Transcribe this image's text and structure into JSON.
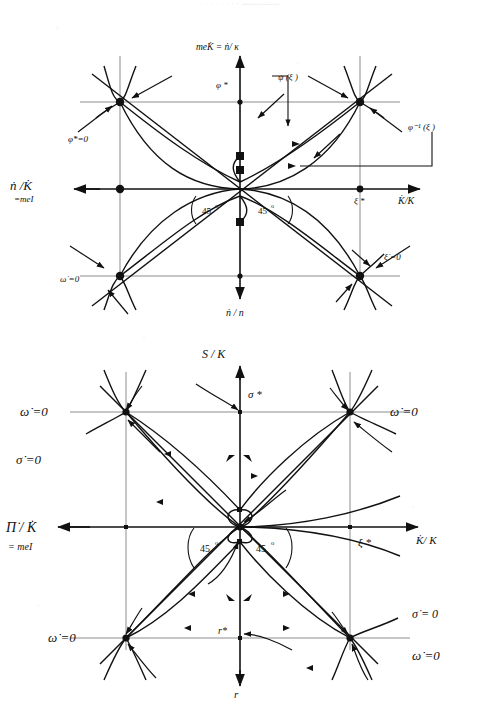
{
  "document": {
    "type": "scanned-figure-page",
    "header_faint_text": "· · ·   ·  ·                                      ·    ·  ▫ ▬▬▬▬▬",
    "ink_color": "#111111",
    "grid_color": "#8d8d8d",
    "paper_color": "#ffffff"
  },
  "figures": [
    {
      "id": "figure-1",
      "name": "phase-diagram-top",
      "axes": {
        "vertical_top_label": "meK̇ =  ṅ/ κ",
        "vertical_bottom_label": "ṅ / n",
        "horizontal_left_label": "ṅ /K̇",
        "horizontal_left_sublabel": "=meI",
        "horizontal_right_label": "K̇/K"
      },
      "markers": {
        "upper_star": "φ *",
        "right_star": "ξ *",
        "angle_left": "45",
        "angle_right": "45",
        "degree": "o"
      },
      "annotations": [
        {
          "name": "psi-xi-label",
          "text": "ψ (ξ )"
        },
        {
          "name": "phi-inverse-xi-label",
          "text": "φ⁻¹ (ξ )"
        },
        {
          "name": "phi-dot-star-zero-label",
          "text": "φ̇*=0"
        },
        {
          "name": "omega-dot-zero-label",
          "text": "ω̇ =0"
        },
        {
          "name": "xi-dot-zero-label",
          "text": "ξ̇ =0"
        }
      ]
    },
    {
      "id": "figure-2",
      "name": "phase-diagram-bottom",
      "axes": {
        "vertical_top_label": "S / K",
        "vertical_bottom_label": "r",
        "horizontal_left_label": "Π̇ / K̇",
        "horizontal_left_sublabel": "= meI",
        "horizontal_right_label": "K̇/ K"
      },
      "markers": {
        "upper_star": "σ *",
        "right_star": "ξ *",
        "lower_star": "r*",
        "angle_left": "45",
        "angle_right": "45",
        "degree": "o"
      },
      "annotations": [
        {
          "name": "omega-dot-zero-label-topleft",
          "text": "ω̇ =0"
        },
        {
          "name": "omega-dot-zero-label-topright",
          "text": "ω̇ =0"
        },
        {
          "name": "sigma-dot-zero-label-left",
          "text": "σ̇ =0"
        },
        {
          "name": "omega-dot-zero-label-bottomleft",
          "text": "ω̇ =0"
        },
        {
          "name": "sigma-dot-zero-label-bottomright",
          "text": "σ̇ = 0"
        },
        {
          "name": "omega-dot-zero-label-bottomright",
          "text": "ω̇ =0"
        }
      ]
    }
  ]
}
